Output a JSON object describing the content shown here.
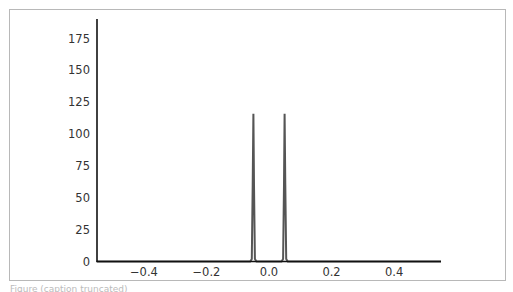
{
  "chart_data": {
    "type": "line",
    "title": "",
    "xlabel": "",
    "ylabel": "",
    "xlim": [
      -0.55,
      0.55
    ],
    "ylim": [
      0,
      190
    ],
    "grid": false,
    "legend": null,
    "x_ticks": [
      "−0.4",
      "−0.2",
      "0.0",
      "0.2",
      "0.4"
    ],
    "x_tick_values": [
      -0.4,
      -0.2,
      0.0,
      0.2,
      0.4
    ],
    "y_ticks": [
      "0",
      "25",
      "50",
      "75",
      "100",
      "125",
      "150",
      "175"
    ],
    "y_tick_values": [
      0,
      25,
      50,
      75,
      100,
      125,
      150,
      175
    ],
    "series": [
      {
        "name": "signal",
        "color": "#555555",
        "x": [
          -0.55,
          -0.06,
          -0.055,
          -0.052,
          -0.05,
          -0.048,
          -0.045,
          -0.04,
          0.04,
          0.045,
          0.048,
          0.05,
          0.052,
          0.055,
          0.06,
          0.55
        ],
        "y": [
          0,
          0,
          2,
          60,
          116,
          60,
          2,
          0,
          0,
          2,
          60,
          116,
          60,
          2,
          0,
          0
        ]
      }
    ],
    "annotations": []
  },
  "caption": "Figure (caption truncated)"
}
